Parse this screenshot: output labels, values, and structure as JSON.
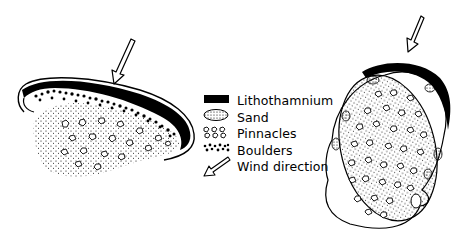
{
  "figure": {
    "left_structure": {
      "name": "Elongated reef (crescent shaped)",
      "wind_arrow_direction": "from upper right toward lower left"
    },
    "right_structure": {
      "name": "Oval reef",
      "wind_arrow_direction": "from upper right toward lower left"
    }
  },
  "legend": {
    "items": [
      {
        "symbol": "solid-black-band",
        "label": "Lithothamnium"
      },
      {
        "symbol": "dotted-oval",
        "label": "Sand"
      },
      {
        "symbol": "open-polygons",
        "label": "Pinnacles"
      },
      {
        "symbol": "black-dots",
        "label": "Boulders"
      },
      {
        "symbol": "hollow-arrow",
        "label": "Wind direction"
      }
    ]
  },
  "colors": {
    "ink": "#000000",
    "paper": "#ffffff"
  }
}
